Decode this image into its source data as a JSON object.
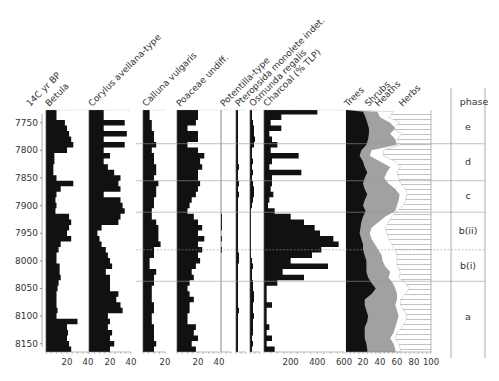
{
  "chart_data": {
    "type": "area",
    "title": "",
    "y_axis": {
      "label": "14C yr BP",
      "ticks": [
        7750,
        7800,
        7850,
        7900,
        7950,
        8000,
        8050,
        8100,
        8150
      ],
      "range": [
        7727,
        8165
      ],
      "inverted": true
    },
    "ages": [
      7730,
      7740,
      7750,
      7760,
      7770,
      7780,
      7790,
      7800,
      7810,
      7820,
      7830,
      7840,
      7850,
      7860,
      7870,
      7880,
      7890,
      7900,
      7910,
      7920,
      7930,
      7940,
      7950,
      7960,
      7970,
      7980,
      7990,
      8000,
      8010,
      8020,
      8030,
      8040,
      8050,
      8060,
      8070,
      8080,
      8090,
      8100,
      8110,
      8120,
      8130,
      8140,
      8150,
      8160
    ],
    "panels": [
      {
        "name": "Betula",
        "xlim": [
          0,
          40
        ],
        "ticks": [
          20,
          40
        ],
        "values": [
          10,
          10,
          18,
          20,
          22,
          24,
          26,
          20,
          8,
          8,
          7,
          7,
          10,
          26,
          14,
          10,
          9,
          10,
          9,
          22,
          24,
          22,
          20,
          24,
          14,
          12,
          10,
          10,
          13,
          13,
          14,
          12,
          11,
          10,
          10,
          10,
          11,
          10,
          30,
          20,
          21,
          20,
          22,
          24
        ]
      },
      {
        "name": "Corylus avellana-type",
        "xlim": [
          0,
          40
        ],
        "ticks": [
          20,
          40
        ],
        "values": [
          14,
          14,
          34,
          14,
          36,
          14,
          34,
          14,
          20,
          14,
          18,
          24,
          30,
          28,
          30,
          14,
          30,
          32,
          34,
          30,
          28,
          12,
          8,
          10,
          12,
          16,
          18,
          20,
          22,
          16,
          20,
          20,
          20,
          28,
          26,
          30,
          32,
          18,
          20,
          18,
          22,
          20,
          24,
          20
        ]
      },
      {
        "name": "Calluna vulgaris",
        "xlim": [
          0,
          20
        ],
        "ticks": [
          20
        ],
        "values": [
          6,
          6,
          8,
          8,
          10,
          10,
          12,
          8,
          10,
          10,
          12,
          12,
          10,
          14,
          12,
          12,
          10,
          10,
          8,
          8,
          12,
          14,
          14,
          14,
          16,
          10,
          10,
          6,
          6,
          12,
          10,
          10,
          8,
          8,
          8,
          10,
          10,
          8,
          8,
          10,
          10,
          10,
          12,
          10
        ]
      },
      {
        "name": "Poaceae undiff.",
        "xlim": [
          0,
          40
        ],
        "ticks": [
          20,
          40
        ],
        "values": [
          20,
          20,
          18,
          10,
          20,
          20,
          10,
          20,
          26,
          22,
          24,
          20,
          20,
          22,
          20,
          18,
          14,
          12,
          10,
          16,
          20,
          24,
          20,
          26,
          20,
          24,
          20,
          22,
          18,
          14,
          16,
          12,
          10,
          12,
          16,
          12,
          12,
          10,
          10,
          18,
          16,
          20,
          14,
          18
        ]
      },
      {
        "name": "Potentilla-type",
        "xlim": [
          0,
          10
        ],
        "ticks": [],
        "values": [
          0,
          0,
          0,
          0,
          0,
          0,
          0,
          0,
          0,
          0,
          0,
          0,
          0,
          0,
          0,
          0,
          0,
          0,
          0,
          1,
          1,
          1,
          0,
          1,
          0,
          1,
          0,
          0,
          0,
          0,
          0,
          0,
          0,
          0,
          0,
          0,
          0,
          0,
          0,
          0,
          0,
          0,
          0,
          0
        ]
      },
      {
        "name": "Pteropsida monolete indet.",
        "xlim": [
          0,
          10
        ],
        "ticks": [],
        "values": [
          2,
          2,
          2,
          2,
          2,
          2,
          2,
          2,
          2,
          2,
          3,
          2,
          2,
          3,
          2,
          3,
          2,
          2,
          2,
          2,
          2,
          2,
          2,
          2,
          2,
          2,
          3,
          3,
          2,
          2,
          2,
          2,
          2,
          2,
          2,
          2,
          3,
          2,
          2,
          2,
          2,
          2,
          2,
          2
        ]
      },
      {
        "name": "Osmunda regalis",
        "xlim": [
          0,
          10
        ],
        "ticks": [],
        "values": [
          2,
          2,
          3,
          4,
          4,
          5,
          4,
          2,
          2,
          3,
          2,
          3,
          2,
          3,
          4,
          4,
          3,
          2,
          1,
          1,
          1,
          1,
          1,
          1,
          1,
          1,
          1,
          2,
          3,
          2,
          2,
          3,
          3,
          4,
          4,
          3,
          3,
          4,
          3,
          3,
          3,
          2,
          3,
          2
        ]
      },
      {
        "name": "Charcoal (% TLP)",
        "xlim": [
          0,
          600
        ],
        "ticks": [
          200,
          400,
          600
        ],
        "values": [
          400,
          130,
          50,
          130,
          40,
          60,
          100,
          50,
          260,
          60,
          40,
          280,
          60,
          60,
          50,
          70,
          40,
          30,
          80,
          200,
          300,
          380,
          420,
          520,
          560,
          430,
          360,
          200,
          480,
          140,
          300,
          100,
          20,
          20,
          20,
          60,
          20,
          20,
          20,
          40,
          20,
          60,
          20,
          80
        ]
      }
    ],
    "summary_panel": {
      "name": "Trees / Shrubs / Heaths / Herbs",
      "xlim": [
        0,
        100
      ],
      "ticks": [
        20,
        40,
        60,
        80,
        100
      ],
      "series": [
        {
          "name": "Trees",
          "color": "#111111",
          "values": [
            20,
            23,
            25,
            27,
            27,
            26,
            24,
            18,
            16,
            20,
            22,
            25,
            22,
            20,
            22,
            25,
            22,
            20,
            23,
            20,
            18,
            17,
            16,
            18,
            20,
            20,
            22,
            24,
            24,
            24,
            26,
            30,
            35,
            30,
            22,
            22,
            24,
            26,
            25,
            22,
            22,
            22,
            24,
            25
          ]
        },
        {
          "name": "Shrubs",
          "color": "#9a9a9a",
          "values": [
            37,
            40,
            52,
            58,
            52,
            58,
            60,
            30,
            28,
            40,
            52,
            48,
            45,
            50,
            58,
            63,
            62,
            60,
            58,
            46,
            38,
            30,
            28,
            30,
            34,
            38,
            42,
            43,
            46,
            52,
            50,
            55,
            58,
            60,
            60,
            58,
            60,
            62,
            60,
            58,
            56,
            52,
            56,
            58
          ]
        },
        {
          "name": "Heaths",
          "color": "#ffffff",
          "values": [
            56,
            50,
            64,
            54,
            66,
            60,
            64,
            44,
            44,
            58,
            64,
            60,
            62,
            64,
            70,
            72,
            70,
            68,
            60,
            54,
            50,
            46,
            48,
            50,
            54,
            58,
            60,
            60,
            60,
            64,
            62,
            70,
            74,
            70,
            64,
            64,
            68,
            72,
            70,
            66,
            60,
            58,
            62,
            64
          ]
        },
        {
          "name": "Herbs",
          "color": "#ffffff",
          "hatch": "horizontal",
          "values": [
            100,
            100,
            100,
            100,
            100,
            100,
            100,
            100,
            100,
            100,
            100,
            100,
            100,
            100,
            100,
            100,
            100,
            100,
            100,
            100,
            100,
            100,
            100,
            100,
            100,
            100,
            100,
            100,
            100,
            100,
            100,
            100,
            100,
            100,
            100,
            100,
            100,
            100,
            100,
            100,
            100,
            100,
            100,
            100
          ]
        }
      ]
    },
    "phases": [
      {
        "label": "e",
        "from": 7727,
        "to": 7788
      },
      {
        "label": "d",
        "from": 7788,
        "to": 7855
      },
      {
        "label": "c",
        "from": 7855,
        "to": 7912
      },
      {
        "label": "b(ii)",
        "from": 7912,
        "to": 7980
      },
      {
        "label": "b(i)",
        "from": 7980,
        "to": 8037
      },
      {
        "label": "a",
        "from": 8037,
        "to": 8165
      }
    ],
    "phase_column_title": "phase"
  }
}
